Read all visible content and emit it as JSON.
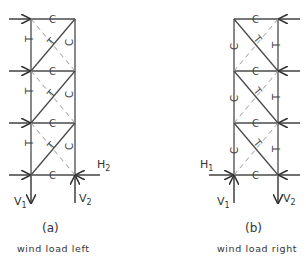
{
  "figure_a": {
    "caption": "(a)",
    "description": "wind load left",
    "member_labels": {
      "horizontal": "C",
      "right_column": "C",
      "left_column": "T",
      "diagonal": "T"
    },
    "reactions": {
      "v1": "V",
      "v1_sub": "1",
      "v2": "V",
      "v2_sub": "2",
      "h2": "H",
      "h2_sub": "2"
    }
  },
  "figure_b": {
    "caption": "(b)",
    "description": "wind load right",
    "member_labels": {
      "horizontal": "C",
      "left_column": "C",
      "right_column": "T",
      "diagonal": "T"
    },
    "reactions": {
      "v1": "V",
      "v1_sub": "1",
      "v2": "V",
      "v2_sub": "2",
      "h1": "H",
      "h1_sub": "1"
    }
  }
}
